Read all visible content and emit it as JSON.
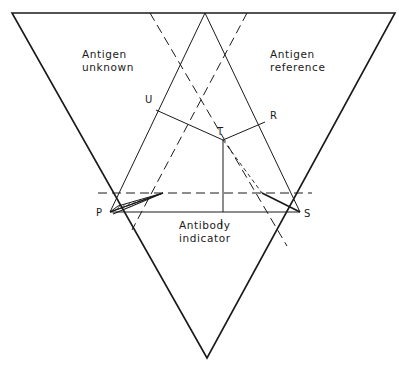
{
  "diagram": {
    "regions": {
      "top_left": {
        "line1": "Antigen",
        "line2": "unknown"
      },
      "top_right": {
        "line1": "Antigen",
        "line2": "reference"
      },
      "bottom": {
        "line1": "Antibody",
        "line2": "indicator"
      }
    },
    "points": {
      "P": "P",
      "S": "S",
      "U": "U",
      "R": "R",
      "T": "T",
      "I": "I"
    },
    "colors": {
      "line": "#1a1a1a",
      "background": "#ffffff"
    }
  }
}
